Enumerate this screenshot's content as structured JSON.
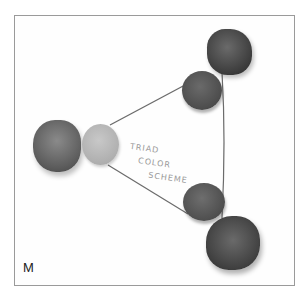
{
  "image": {
    "description": "Photo of clay disks arranged at three corners of a triangle connected by a thin cord, with handwritten label",
    "handwritten_label": [
      "TRIAD",
      "COLOR",
      "SCHEME"
    ],
    "corner_mark": "M",
    "elements": [
      {
        "name": "top-right-lump",
        "tone": "#4a4a4a"
      },
      {
        "name": "top-right-disk",
        "tone": "#555555"
      },
      {
        "name": "left-lump",
        "tone": "#6a6a6a"
      },
      {
        "name": "left-disk",
        "tone": "#b9b9b9"
      },
      {
        "name": "bottom-right-disk",
        "tone": "#5a5a5a"
      },
      {
        "name": "bottom-right-lump",
        "tone": "#444444"
      }
    ]
  }
}
